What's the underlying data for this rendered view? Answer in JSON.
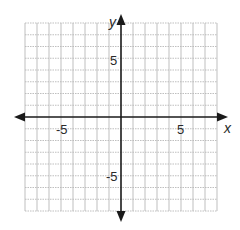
{
  "chart_data": {
    "type": "scatter",
    "title": "",
    "xlabel": "x",
    "ylabel": "y",
    "xlim": [
      -8,
      8
    ],
    "ylim": [
      -8,
      8
    ],
    "grid": true,
    "x_tick_labels": [
      {
        "value": -5,
        "label": "-5"
      },
      {
        "value": 5,
        "label": "5"
      }
    ],
    "y_tick_labels": [
      {
        "value": 5,
        "label": "5"
      },
      {
        "value": -5,
        "label": "-5"
      }
    ],
    "series": []
  },
  "colors": {
    "axis": "#1a1a1a",
    "grid": "#b8b8b8",
    "background": "#ffffff"
  },
  "labels": {
    "x_axis": "x",
    "y_axis": "y",
    "x_neg5": "-5",
    "x_pos5": "5",
    "y_pos5": "5",
    "y_neg5": "-5"
  }
}
